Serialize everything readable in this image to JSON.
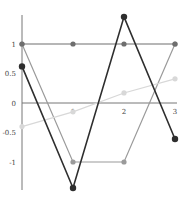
{
  "chart_data": {
    "type": "line",
    "title": "",
    "xlabel": "",
    "ylabel": "",
    "x": [
      0,
      1,
      2,
      3
    ],
    "xlim": [
      0,
      3
    ],
    "ylim": [
      -1.5,
      1.5
    ],
    "grid": false,
    "legend": null,
    "x_ticks": [
      "1",
      "2",
      "3"
    ],
    "y_ticks": [
      "1",
      "0.5",
      "0",
      "-0.5",
      "-1"
    ],
    "series": [
      {
        "name": "series-1",
        "color": "#9a9a9a",
        "values": [
          1,
          -1,
          -1,
          1
        ]
      },
      {
        "name": "series-2",
        "color": "#d8d8d8",
        "values": [
          -0.4,
          -0.15,
          0.17,
          0.41
        ]
      },
      {
        "name": "series-3",
        "color": "#6e6e6e",
        "values": [
          1,
          1,
          1,
          1
        ]
      },
      {
        "name": "series-4",
        "color": "#2e2e2e",
        "values": [
          0.62,
          -1.44,
          1.46,
          -0.61
        ]
      }
    ]
  }
}
